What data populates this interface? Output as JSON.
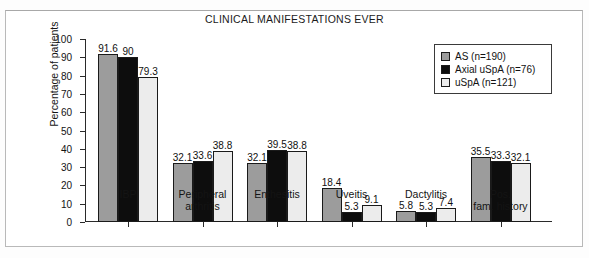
{
  "chart_data": {
    "type": "bar",
    "title": "CLINICAL MANIFESTATIONS EVER",
    "xlabel": "",
    "ylabel": "Percentage of patients",
    "ylim": [
      0,
      100
    ],
    "ytick_step": 10,
    "yticks": [
      0,
      10,
      20,
      30,
      40,
      50,
      60,
      70,
      80,
      90,
      100
    ],
    "grid": false,
    "legend_position": "top-right",
    "categories": [
      "IBP",
      "Peripheral\narthritis",
      "Enthesitis",
      "Uveitis",
      "Dactylitis",
      "Pos.\nfam. history"
    ],
    "series": [
      {
        "name": "AS (n=190)",
        "color": "#9c9c9c",
        "values": [
          91.6,
          32.1,
          32.1,
          18.4,
          5.8,
          35.5
        ]
      },
      {
        "name": "Axial uSpA (n=76)",
        "color": "#0d0d0d",
        "values": [
          90,
          33.6,
          39.5,
          5.3,
          5.3,
          33.3
        ]
      },
      {
        "name": "uSpA (n=121)",
        "color": "#ececec",
        "values": [
          79.3,
          38.8,
          38.8,
          9.1,
          7.4,
          32.1
        ]
      }
    ],
    "value_labels": [
      [
        "91.6",
        "90",
        "79.3"
      ],
      [
        "32.1",
        "33.6",
        "38.8"
      ],
      [
        "32.1",
        "39.5",
        "38.8"
      ],
      [
        "18.4",
        "5.3",
        "9.1"
      ],
      [
        "5.8",
        "5.3",
        "7.4"
      ],
      [
        "35.5",
        "33.3",
        "32.1"
      ]
    ]
  },
  "legend": {
    "items": [
      {
        "label": "AS (n=190)"
      },
      {
        "label": "Axial uSpA (n=76)"
      },
      {
        "label": "uSpA (n=121)"
      }
    ]
  }
}
